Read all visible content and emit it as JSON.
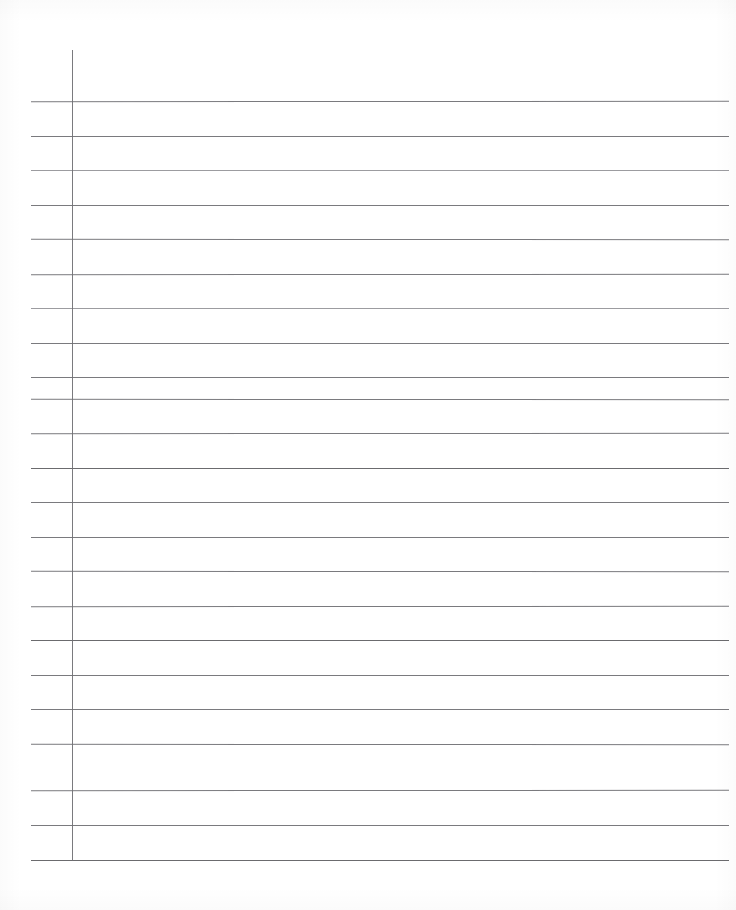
{
  "document": {
    "kind": "lined-notebook-paper",
    "title": "Blank ruled paper sheet",
    "page_width": 736,
    "page_height": 910,
    "background_color": "#ffffff",
    "rule_color": "#6f6f73",
    "margin_rule_color": "#6f6f73",
    "written_text": "",
    "ruling": {
      "type": "horizontal-rules-with-left-margin",
      "line_count": 23,
      "line_spacing_px": 34.5,
      "first_line_y": 101,
      "last_line_y": 860,
      "line_left_x": 31,
      "line_right_x": 729,
      "margin_line_x": 72,
      "margin_line_top_y": 50,
      "margin_line_bottom_y": 861
    },
    "rules": [
      {
        "y": 101,
        "x1": 31,
        "x2": 729,
        "weight": "normal"
      },
      {
        "y": 136,
        "x1": 31,
        "x2": 729,
        "weight": "normal"
      },
      {
        "y": 170,
        "x1": 31,
        "x2": 729,
        "weight": "faint"
      },
      {
        "y": 205,
        "x1": 31,
        "x2": 729,
        "weight": "normal"
      },
      {
        "y": 239,
        "x1": 31,
        "x2": 729,
        "weight": "normal"
      },
      {
        "y": 274,
        "x1": 31,
        "x2": 729,
        "weight": "normal"
      },
      {
        "y": 308,
        "x1": 31,
        "x2": 729,
        "weight": "faint"
      },
      {
        "y": 343,
        "x1": 31,
        "x2": 729,
        "weight": "normal"
      },
      {
        "y": 377,
        "x1": 31,
        "x2": 729,
        "weight": "normal"
      },
      {
        "y": 399,
        "x1": 31,
        "x2": 729,
        "weight": "normal"
      },
      {
        "y": 433,
        "x1": 31,
        "x2": 729,
        "weight": "normal"
      },
      {
        "y": 468,
        "x1": 31,
        "x2": 729,
        "weight": "strong"
      },
      {
        "y": 502,
        "x1": 31,
        "x2": 729,
        "weight": "normal"
      },
      {
        "y": 537,
        "x1": 31,
        "x2": 729,
        "weight": "normal"
      },
      {
        "y": 571,
        "x1": 31,
        "x2": 729,
        "weight": "normal"
      },
      {
        "y": 606,
        "x1": 31,
        "x2": 729,
        "weight": "normal"
      },
      {
        "y": 640,
        "x1": 31,
        "x2": 729,
        "weight": "strong"
      },
      {
        "y": 675,
        "x1": 31,
        "x2": 729,
        "weight": "normal"
      },
      {
        "y": 709,
        "x1": 31,
        "x2": 729,
        "weight": "normal"
      },
      {
        "y": 744,
        "x1": 31,
        "x2": 729,
        "weight": "normal"
      },
      {
        "y": 790,
        "x1": 31,
        "x2": 729,
        "weight": "normal"
      },
      {
        "y": 825,
        "x1": 31,
        "x2": 729,
        "weight": "normal"
      },
      {
        "y": 860,
        "x1": 31,
        "x2": 729,
        "weight": "strong"
      }
    ]
  }
}
